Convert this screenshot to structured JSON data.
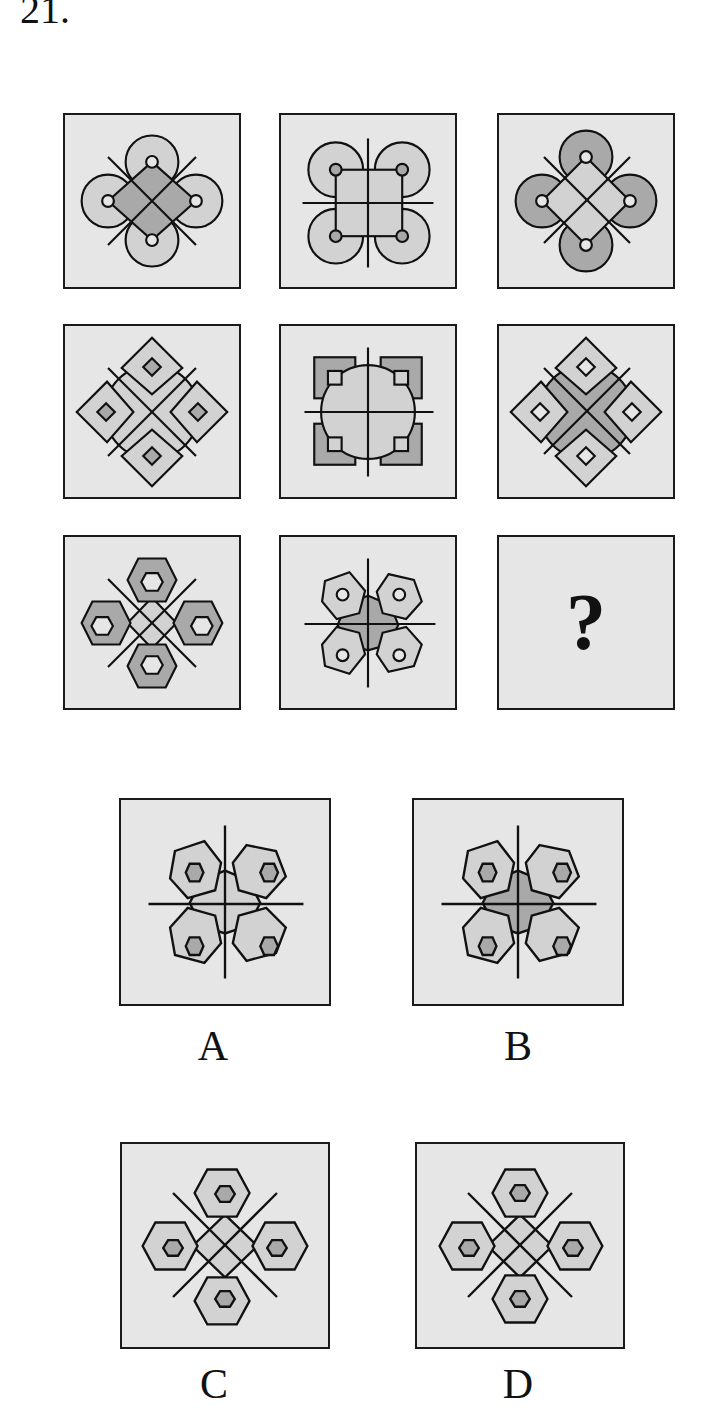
{
  "question": {
    "number": "21.",
    "missing_mark": "?"
  },
  "colors": {
    "panel_bg": "#e6e6e6",
    "light_fill": "#d2d2d2",
    "dark_fill": "#a9a9a9",
    "stroke": "#111111"
  },
  "matrix": {
    "rows": [
      [
        {
          "id": "r1c1",
          "shape": "circles",
          "layout": "diagonal-cross",
          "outer_fill": "light",
          "center_fill": "dark",
          "inner_fill": "light"
        },
        {
          "id": "r1c2",
          "shape": "circles",
          "layout": "orthogonal-cross",
          "outer_fill": "light",
          "center_fill": "light",
          "inner_fill": "dark"
        },
        {
          "id": "r1c3",
          "shape": "circles",
          "layout": "diagonal-cross",
          "outer_fill": "dark",
          "center_fill": "light",
          "inner_fill": "light"
        }
      ],
      [
        {
          "id": "r2c1",
          "shape": "diamonds",
          "layout": "diagonal-cross",
          "outer_fill": "light",
          "center_fill": "light",
          "inner_fill": "dark"
        },
        {
          "id": "r2c2",
          "shape": "squares",
          "layout": "orthogonal-cross",
          "outer_fill": "dark",
          "center_fill": "light",
          "inner_fill": "light"
        },
        {
          "id": "r2c3",
          "shape": "diamonds",
          "layout": "diagonal-cross",
          "outer_fill": "light",
          "center_fill": "dark",
          "inner_fill": "light"
        }
      ],
      [
        {
          "id": "r3c1",
          "shape": "hexagons",
          "layout": "diagonal-cross",
          "outer_fill": "dark",
          "center_fill": "light",
          "inner_fill": "light"
        },
        {
          "id": "r3c2",
          "shape": "hexagons",
          "layout": "orthogonal-cross",
          "outer_fill": "light",
          "center_fill": "dark",
          "inner_fill": "light"
        },
        {
          "id": "r3c3",
          "missing": true
        }
      ]
    ]
  },
  "options": [
    {
      "label": "A",
      "shape": "hexagons",
      "layout": "orthogonal-cross",
      "outer_fill": "light",
      "center_fill": "light",
      "inner_fill": "dark"
    },
    {
      "label": "B",
      "shape": "hexagons",
      "layout": "orthogonal-cross",
      "outer_fill": "light",
      "center_fill": "dark",
      "inner_fill": "dark"
    },
    {
      "label": "C",
      "shape": "hexagons",
      "layout": "diagonal-cross",
      "outer_fill": "light",
      "center_fill": "light",
      "inner_fill": "dark"
    },
    {
      "label": "D",
      "shape": "hexagons",
      "layout": "diagonal-cross",
      "outer_fill": "light",
      "center_fill": "light",
      "inner_fill": "dark"
    }
  ]
}
